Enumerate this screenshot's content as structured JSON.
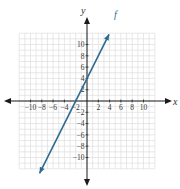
{
  "chart_data": {
    "type": "line",
    "title": "",
    "xlabel": "x",
    "ylabel": "y",
    "xlim": [
      -12,
      12
    ],
    "ylim": [
      -12,
      12
    ],
    "grid": true,
    "xticks": [
      -10,
      -8,
      -6,
      -4,
      -2,
      2,
      4,
      6,
      8,
      10
    ],
    "yticks": [
      -10,
      -8,
      -6,
      -4,
      -2,
      2,
      4,
      6,
      8,
      10
    ],
    "xtick_labels": [
      "−10",
      "−8",
      "−6",
      "−4",
      "−2",
      "2",
      "4",
      "6",
      "8",
      "10"
    ],
    "ytick_labels": [
      "−10",
      "−8",
      "−6",
      "−4",
      "−2",
      "2",
      "4",
      "6",
      "8",
      "10"
    ],
    "series": [
      {
        "name": "f",
        "equation": "f(x) = 2x + 4",
        "slope": 2,
        "intercept": 4,
        "x": [
          -8.4,
          3.9
        ],
        "values": [
          -12.8,
          11.8
        ],
        "color": "#2e6b8f",
        "arrows": "both"
      }
    ],
    "legend": [],
    "annotations": [
      {
        "text": "f",
        "x": 4.8,
        "y": 14.7
      }
    ]
  },
  "colors": {
    "axis": "#1a1a1a",
    "grid": "#d9d9d9",
    "line": "#2e6b8f"
  }
}
